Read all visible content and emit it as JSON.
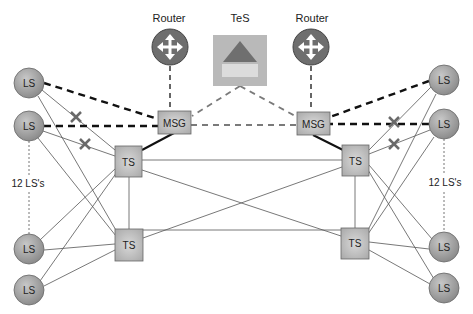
{
  "colors": {
    "node_fill": "#9a9a9a",
    "box_fill": "#c4c4c4",
    "router_fill": "#6e6e6e",
    "tes_fill": "#b9b9b9",
    "tes_triangle": "#6f6f6f",
    "tes_bar": "#dcdcdc",
    "line": "#555555",
    "dash_black": "#111111",
    "dash_gray": "#7a7a7a",
    "x_mark": "#6a6a6a"
  },
  "labels": {
    "router_left": "Router",
    "router_right": "Router",
    "tes": "TeS",
    "msg_left": "MSG",
    "msg_right": "MSG",
    "ts": "TS",
    "ls": "LS",
    "ls_count_left": "12 LS's",
    "ls_count_right": "12 LS's"
  },
  "nodes": {
    "router_left": {
      "type": "router",
      "label": "Router",
      "x": 170,
      "y": 47
    },
    "router_right": {
      "type": "router",
      "label": "Router",
      "x": 311,
      "y": 47
    },
    "tes": {
      "type": "tes",
      "label": "TeS",
      "x": 240,
      "y": 60
    },
    "msg_left": {
      "type": "msg",
      "label": "MSG",
      "x": 174,
      "y": 122
    },
    "msg_right": {
      "type": "msg",
      "label": "MSG",
      "x": 313,
      "y": 123
    },
    "ts_left_top": {
      "type": "ts",
      "label": "TS",
      "x": 128,
      "y": 162
    },
    "ts_left_bottom": {
      "type": "ts",
      "label": "TS",
      "x": 129,
      "y": 245
    },
    "ts_right_top": {
      "type": "ts",
      "label": "TS",
      "x": 355,
      "y": 161
    },
    "ts_right_bottom": {
      "type": "ts",
      "label": "TS",
      "x": 355,
      "y": 243
    },
    "ls_left": [
      {
        "label": "LS",
        "x": 29,
        "y": 83
      },
      {
        "label": "LS",
        "x": 29,
        "y": 126
      },
      {
        "label": "LS",
        "x": 29,
        "y": 249
      },
      {
        "label": "LS",
        "x": 29,
        "y": 290
      }
    ],
    "ls_right": [
      {
        "label": "LS",
        "x": 444,
        "y": 80
      },
      {
        "label": "LS",
        "x": 444,
        "y": 124
      },
      {
        "label": "LS",
        "x": 444,
        "y": 247
      },
      {
        "label": "LS",
        "x": 444,
        "y": 288
      }
    ]
  },
  "edges_description": [
    "Router (left) -- MSG (left): dashed",
    "Router (right) -- MSG (right): dashed",
    "TeS -- MSG (left): gray dashed",
    "TeS -- MSG (right): gray dashed",
    "MSG (left) -- MSG (right): gray dashed",
    "LS top two (each side) -- MSG: thick black dashed",
    "MSG -- TS top (each side): thick solid",
    "TS top -- TS bottom (each side): thin solid",
    "TS left -- TS right: thin solid (straight and crossed)",
    "Each LS -- both TS on its side: thin solid; top two LS links to TS top marked with X (failed)",
    "LS 2 -- LS 3 on each side: dotted (12 LS's)"
  ]
}
